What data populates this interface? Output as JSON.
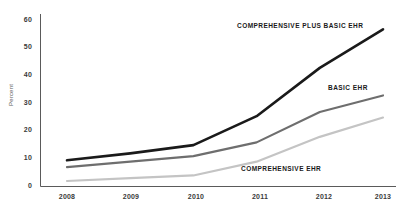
{
  "chart_data": {
    "type": "line",
    "title": "",
    "subtitle": "",
    "xlabel": "",
    "ylabel": "Percent",
    "categories": [
      "2008",
      "2009",
      "2010",
      "2011",
      "2012",
      "2013"
    ],
    "x": [
      2008,
      2009,
      2010,
      2011,
      2012,
      2013
    ],
    "xlim": [
      2008,
      2013
    ],
    "ylim": [
      0,
      60
    ],
    "yticks": [
      0,
      10,
      20,
      30,
      40,
      50,
      60
    ],
    "grid": false,
    "legend_position": "inline-annotations",
    "series": [
      {
        "name": "COMPREHENSIVE PLUS BASIC EHR",
        "color": "#1a1a1a",
        "values": [
          9.5,
          12.0,
          15.0,
          25.5,
          43.0,
          57.0
        ]
      },
      {
        "name": "BASIC EHR",
        "color": "#6e6e6e",
        "values": [
          7.0,
          9.0,
          11.0,
          16.0,
          27.0,
          33.0
        ]
      },
      {
        "name": "COMPREHENSIVE EHR",
        "color": "#c4c4c4",
        "values": [
          2.0,
          3.0,
          4.0,
          9.0,
          18.0,
          25.0
        ]
      }
    ],
    "annotations": [
      {
        "text": "COMPREHENSIVE PLUS BASIC EHR",
        "series": "COMPREHENSIVE PLUS BASIC EHR"
      },
      {
        "text": "BASIC EHR",
        "series": "BASIC EHR"
      },
      {
        "text": "COMPREHENSIVE EHR",
        "series": "COMPREHENSIVE EHR"
      }
    ]
  },
  "axis": {
    "y_title": "Percent",
    "y_tick_0": "0",
    "y_tick_10": "10",
    "y_tick_20": "20",
    "y_tick_30": "30",
    "y_tick_40": "40",
    "y_tick_50": "50",
    "y_tick_60": "60",
    "x_tick_2008": "2008",
    "x_tick_2009": "2009",
    "x_tick_2010": "2010",
    "x_tick_2011": "2011",
    "x_tick_2012": "2012",
    "x_tick_2013": "2013",
    "axis_color": "#5a5a5a"
  },
  "labels": {
    "comprehensive_plus_basic": "COMPREHENSIVE PLUS BASIC EHR",
    "basic": "BASIC EHR",
    "comprehensive": "COMPREHENSIVE EHR"
  }
}
